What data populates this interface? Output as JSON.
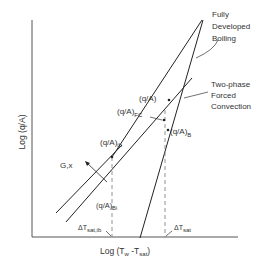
{
  "diagram": {
    "y_axis_label": "Log (q/A)",
    "x_axis_label": "Log (T",
    "x_axis_label_sub_w": "w",
    "x_axis_label_mid": " -T",
    "x_axis_label_sub_sat": "sat",
    "x_axis_label_end": ")",
    "curve_labels": {
      "fully_developed_boiling": [
        "Fully",
        "Developed",
        "Boiling"
      ],
      "two_phase_forced_convection": [
        "Two-phase",
        "Forced",
        "Convection"
      ]
    },
    "point_labels": {
      "q_a": "(q/A)",
      "q_a_fc": "(q/A)",
      "q_a_fc_sub": "FC",
      "q_a_ib": "(q/A)",
      "q_a_ib_sub": "ib",
      "q_a_b": "(q/A)",
      "q_a_b_sub": "B",
      "q_a_bi": "(q/A)",
      "q_a_bi_sub": "Bi",
      "param_arrow": "G,x"
    },
    "axis_markers": {
      "dt_sat_ib": "ΔT",
      "dt_sat_ib_sub": "sat,ib",
      "dt_sat": "ΔT",
      "dt_sat_sub": "sat"
    }
  }
}
